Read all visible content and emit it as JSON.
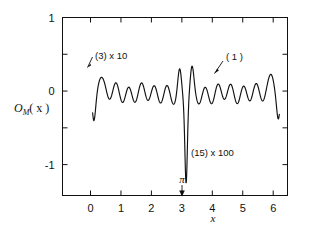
{
  "figure": {
    "background": "#ffffff",
    "ink": "#111111",
    "width": 319,
    "height": 235
  },
  "chart_data": {
    "type": "line",
    "title": "",
    "subtitle": "",
    "xlabel": "x",
    "ylabel": "O_M( x )",
    "ylabel_parts": {
      "symbol": "O",
      "subscript": "M",
      "argument": "( x )"
    },
    "xlim": [
      -0.92,
      6.47
    ],
    "ylim": [
      -1.42,
      1.0
    ],
    "xticks": [
      0,
      1,
      2,
      3,
      4,
      5,
      6
    ],
    "xticklabels": [
      "0",
      "1",
      "2",
      "3",
      "4",
      "5",
      "6"
    ],
    "yticks": [
      -1,
      -0.5,
      0,
      0.5,
      1
    ],
    "yticklabels_shown": [
      "1",
      "0",
      "-1"
    ],
    "ytick_label_values": [
      1,
      0,
      -1
    ],
    "grid": false,
    "legend": "none",
    "frame": "box",
    "tick_direction": "in",
    "ticks_all_sides": true,
    "annotations": [
      {
        "id": "annot-3",
        "text": "(3)   x 10",
        "label": "(3)",
        "multiplier": "x 10",
        "x_data": 0.3,
        "y_data": 0.62,
        "arrow": true,
        "arrow_target": {
          "x": 0.22,
          "y": 0.34
        },
        "description": "order-3 component scaled by 10"
      },
      {
        "id": "annot-1",
        "text": "( 1 )",
        "label": "( 1 )",
        "multiplier": "",
        "x_data": 4.32,
        "y_data": 0.45,
        "arrow": true,
        "arrow_target": {
          "x": 4.02,
          "y": 0.17
        },
        "description": "order-1 component, unscaled"
      },
      {
        "id": "annot-15",
        "text": "(15)   x 100",
        "label": "(15)",
        "multiplier": "x 100",
        "x_data": 3.35,
        "y_data": -0.92,
        "arrow": false,
        "description": "order-15 component scaled by 100"
      },
      {
        "id": "annot-pi",
        "text": "π",
        "label": "π",
        "x_data": 3.14,
        "y_data": -1.16,
        "arrow": true,
        "arrow_target": {
          "x": 3.14,
          "y": -1.38
        },
        "description": "marker for x equals pi on the x-axis"
      }
    ],
    "series": [
      {
        "name": "O_M(x)",
        "style": "solid-black",
        "comment": "oscillatory multi-component curve: ~15 fast cycles over 0..2pi, large negative spike to -1 at x = pi, negative excursions at both domain edges",
        "x_start": 0.07,
        "x_end": 6.2,
        "samples": 620,
        "features": {
          "fast_cycles": 15,
          "baseline_level": -0.03,
          "fast_amplitude": 0.115,
          "slow_amplitude": 0.045,
          "center_spike": {
            "x": 3.14,
            "depth": -1.0,
            "width": 0.055
          },
          "center_peaks": [
            {
              "x": 2.93,
              "y": 0.34
            },
            {
              "x": 3.33,
              "y": 0.36
            }
          ],
          "left_edge_dip": {
            "x": 0.1,
            "depth": -0.45
          },
          "right_edge_dip": {
            "x": 6.18,
            "depth": -0.43
          },
          "left_rise_peak": {
            "x": 0.28,
            "y": 0.2
          },
          "right_rise_peak": {
            "x": 5.98,
            "y": 0.2
          }
        }
      }
    ]
  }
}
